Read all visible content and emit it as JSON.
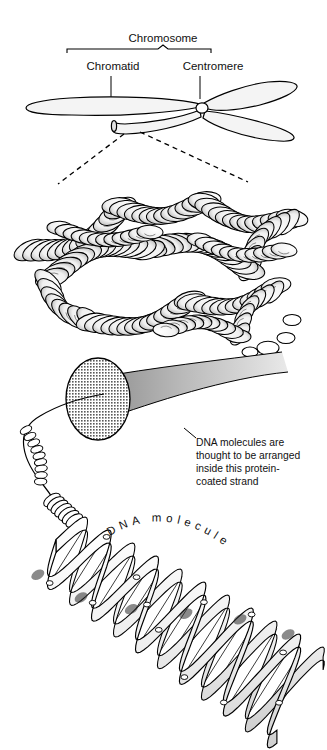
{
  "figure": {
    "type": "scientific-illustration",
    "background_color": "#ffffff",
    "ink_color": "#000000",
    "fill_gray": "#9a9a9a"
  },
  "chromosome_diagram": {
    "bracket_label": "Chromosome",
    "part_labels": [
      {
        "name": "chromatid-label",
        "text": "Chromatid"
      },
      {
        "name": "centromere-label",
        "text": "Centromere"
      }
    ]
  },
  "chromatin": {
    "name": "coiled-chromatin-mass",
    "description": "supercoiled chromatin fiber"
  },
  "protein_strand": {
    "name": "protein-coated-strand-cone",
    "caption_lines": [
      "DNA molecules are",
      "thought to be arranged",
      "inside this protein-",
      "coated strand"
    ]
  },
  "dna": {
    "curved_label": "DNA molecule",
    "curved_label_letters": [
      "D",
      "N",
      "A",
      " ",
      "m",
      "o",
      "l",
      "e",
      "c",
      "u",
      "l",
      "e"
    ]
  }
}
